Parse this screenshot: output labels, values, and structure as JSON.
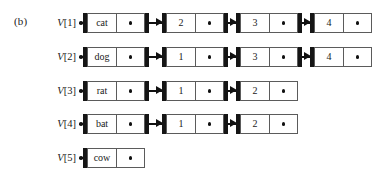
{
  "figure": {
    "part_label": "(b)",
    "caption": "",
    "colors": {
      "ink": "#151515",
      "cell_border": "#5b5b5b",
      "background": "#ffffff"
    }
  },
  "diagram": {
    "type": "linked-list-array",
    "array_name": "V",
    "null_marker": "dot",
    "rows": [
      {
        "slot_label": "V[1]",
        "slot_index": 1,
        "nodes": [
          {
            "key": "cat",
            "next": "pointer"
          },
          {
            "key": "2",
            "next": "pointer"
          },
          {
            "key": "3",
            "next": "pointer"
          },
          {
            "key": "4",
            "next": "null"
          }
        ]
      },
      {
        "slot_label": "V[2]",
        "slot_index": 2,
        "nodes": [
          {
            "key": "dog",
            "next": "pointer"
          },
          {
            "key": "1",
            "next": "pointer"
          },
          {
            "key": "3",
            "next": "pointer"
          },
          {
            "key": "4",
            "next": "null"
          }
        ]
      },
      {
        "slot_label": "V[3]",
        "slot_index": 3,
        "nodes": [
          {
            "key": "rat",
            "next": "pointer"
          },
          {
            "key": "1",
            "next": "pointer"
          },
          {
            "key": "2",
            "next": "null"
          }
        ]
      },
      {
        "slot_label": "V[4]",
        "slot_index": 4,
        "nodes": [
          {
            "key": "bat",
            "next": "pointer"
          },
          {
            "key": "1",
            "next": "pointer"
          },
          {
            "key": "2",
            "next": "null"
          }
        ]
      },
      {
        "slot_label": "V[5]",
        "slot_index": 5,
        "nodes": [
          {
            "key": "cow",
            "next": "null"
          }
        ]
      }
    ]
  },
  "layout": {
    "row_tops": [
      13,
      47,
      81,
      114,
      148
    ],
    "node_lefts": [
      83,
      162,
      236,
      310
    ],
    "key_cell_width": 30,
    "link_cell_width": 28,
    "arrow_gap": 34
  }
}
